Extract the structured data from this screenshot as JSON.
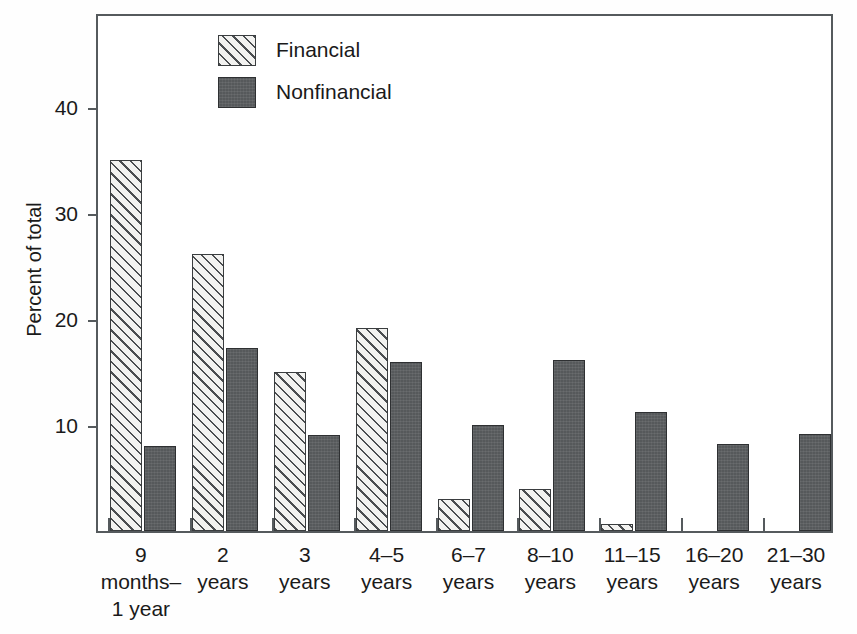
{
  "chart_data": {
    "type": "bar",
    "title": "",
    "subtitle": "",
    "xlabel": "",
    "ylabel": "Percent of total",
    "ylim": [
      0,
      49
    ],
    "yticks": [
      10,
      20,
      30,
      40
    ],
    "grid": false,
    "legend_position": "top-center",
    "categories": [
      "9\nmonths–\n1 year",
      "2\nyears",
      "3\nyears",
      "4–5\nyears",
      "6–7\nyears",
      "8–10\nyears",
      "11–15\nyears",
      "16–20\nyears",
      "21–30\nyears"
    ],
    "category_labels_flat": [
      "9 months–1 year",
      "2 years",
      "3 years",
      "4–5 years",
      "6–7 years",
      "8–10 years",
      "11–15 years",
      "16–20 years",
      "21–30 years"
    ],
    "series": [
      {
        "name": "Financial",
        "fill": "diagonal-hatch",
        "color": "#f2f2f0",
        "values": [
          35,
          26.2,
          15,
          19.2,
          3,
          4,
          0.7,
          0,
          0
        ]
      },
      {
        "name": "Nonfinancial",
        "fill": "solid-dark-gray",
        "color": "#56595b",
        "values": [
          8,
          17.3,
          9.1,
          16,
          10,
          16.1,
          11.2,
          8.2,
          9.2
        ]
      }
    ]
  },
  "legend": {
    "items": [
      {
        "label": "Financial",
        "swatch": "hatched-swatch"
      },
      {
        "label": "Nonfinancial",
        "swatch": "solid-swatch"
      }
    ]
  },
  "axis": {
    "y_title": "Percent of total",
    "y_tick_labels": [
      "40",
      "30",
      "20",
      "10"
    ]
  },
  "colors": {
    "axis": "#555a5d",
    "bar_outline": "#3a3d3f",
    "financial_fill": "#f2f2f0",
    "nonfinancial_fill": "#56595b",
    "text": "#1a1a1a",
    "background": "#ffffff"
  }
}
